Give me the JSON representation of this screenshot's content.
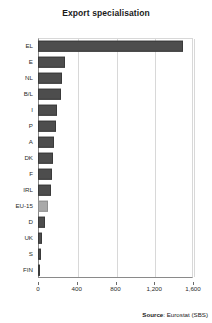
{
  "chart_data": {
    "type": "bar",
    "orientation": "horizontal",
    "title": "Export specialisation",
    "xlabel": "",
    "ylabel": "",
    "xlim": [
      0,
      1600
    ],
    "xticks": [
      0,
      400,
      800,
      1200,
      1600
    ],
    "xticklabels": [
      "0",
      "400",
      "800",
      "1,200",
      "1,600"
    ],
    "grid": "vertical",
    "legend": null,
    "categories": [
      "EL",
      "E",
      "NL",
      "B/L",
      "I",
      "P",
      "A",
      "DK",
      "F",
      "IRL",
      "EU-15",
      "D",
      "UK",
      "S",
      "FIN"
    ],
    "values": [
      1500,
      280,
      250,
      240,
      200,
      185,
      165,
      150,
      140,
      130,
      100,
      70,
      45,
      30,
      20
    ],
    "series": [
      {
        "name": "Export specialisation",
        "values": [
          1500,
          280,
          250,
          240,
          200,
          185,
          165,
          150,
          140,
          130,
          100,
          70,
          45,
          30,
          20
        ]
      }
    ],
    "bar_colors": [
      "#4d4d4d",
      "#4d4d4d",
      "#4d4d4d",
      "#4d4d4d",
      "#4d4d4d",
      "#4d4d4d",
      "#4d4d4d",
      "#4d4d4d",
      "#4d4d4d",
      "#4d4d4d",
      "#a9a9a9",
      "#4d4d4d",
      "#4d4d4d",
      "#4d4d4d",
      "#4d4d4d"
    ],
    "highlight_category": "EU-15",
    "colors": {
      "bar": "#4d4d4d",
      "bar_highlight": "#a9a9a9",
      "grid": "#d8d8d8",
      "axis": "#8a8a8a",
      "text": "#2a2a2a"
    }
  },
  "footer": {
    "source_label": "Source",
    "source_separator": ": ",
    "source_value": "Eurostat (SBS)"
  }
}
